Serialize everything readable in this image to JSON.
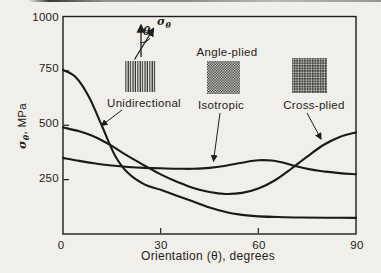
{
  "figure": {
    "paper_color": "#f1efe9",
    "ink_color": "#1d1d1d"
  },
  "chart_data": {
    "type": "line",
    "title": "",
    "xlabel": "Orientation (θ), degrees",
    "ylabel": "σθ, MPa",
    "ylabel_parts": {
      "symbol": "σ",
      "subscript": "θ",
      "rest": ", MPa"
    },
    "xlim": [
      0,
      90
    ],
    "ylim": [
      0,
      1000
    ],
    "x_ticks": [
      0,
      30,
      60,
      90
    ],
    "y_ticks": [
      1000,
      750,
      500,
      250
    ],
    "x_tick_labels": [
      "0",
      "30",
      "60",
      "90"
    ],
    "y_tick_labels": [
      "1000",
      "750",
      "500",
      "250"
    ],
    "grid": false,
    "legend_position": "inset-top",
    "series": [
      {
        "name": "Unidirectional",
        "swatch_pattern": "vertical-lines",
        "x": [
          0,
          4,
          8,
          12,
          16,
          20,
          25,
          30,
          35,
          40,
          45,
          50,
          55,
          60,
          66,
          73,
          81,
          90
        ],
        "y": [
          755,
          720,
          630,
          495,
          360,
          280,
          228,
          203,
          176,
          149,
          122,
          101,
          88,
          81,
          78,
          76,
          75,
          74
        ]
      },
      {
        "name": "Isotropic",
        "swatch_pattern": "checker-weave",
        "x": [
          0,
          5,
          10,
          15,
          20,
          25,
          30,
          35,
          40,
          45,
          50,
          55,
          60,
          64,
          68,
          72,
          76,
          80,
          85,
          90
        ],
        "y": [
          350,
          336,
          324,
          315,
          308,
          304,
          302,
          300,
          300,
          304,
          314,
          328,
          339,
          338,
          327,
          310,
          297,
          288,
          280,
          275
        ]
      },
      {
        "name": "Cross-plied",
        "swatch_pattern": "grid-weave",
        "x": [
          0,
          5,
          10,
          15,
          20,
          25,
          30,
          35,
          40,
          45,
          50,
          55,
          60,
          65,
          70,
          75,
          80,
          85,
          90
        ],
        "y": [
          490,
          472,
          445,
          405,
          358,
          315,
          274,
          240,
          212,
          193,
          184,
          189,
          209,
          246,
          299,
          356,
          409,
          446,
          467
        ]
      }
    ],
    "annotations": {
      "unidirectional_label": "Unidirectional",
      "angle_plied_label": "Angle-plied",
      "isotropic_label": "Isotropic",
      "cross_plied_label": "Cross-plied"
    },
    "inset_angle_diagram": {
      "theta_symbol": "θ",
      "sigma_symbol": "σ",
      "sigma_subscript": "θ"
    }
  }
}
